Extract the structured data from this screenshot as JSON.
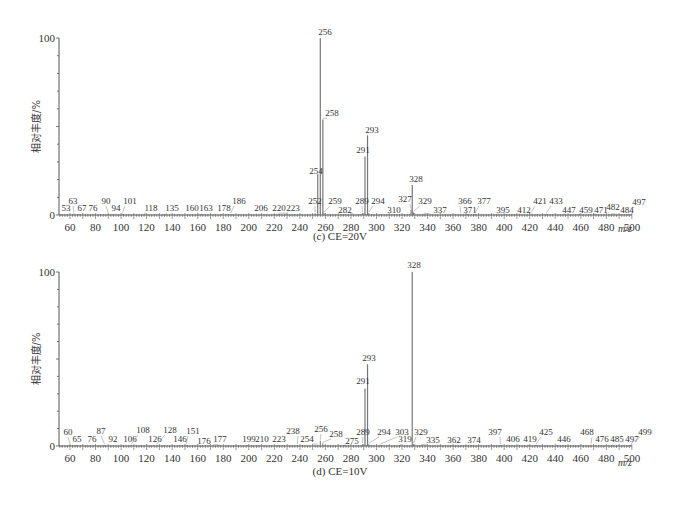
{
  "chart_data": [
    {
      "type": "bar",
      "subtype": "mass-spectrum",
      "title": "(c) CE=20V",
      "xlabel": "m/z",
      "ylabel": "相对丰度/%",
      "xlim": [
        50,
        500
      ],
      "ylim": [
        0,
        100
      ],
      "xticks": [
        60,
        80,
        100,
        120,
        140,
        160,
        180,
        200,
        220,
        240,
        260,
        280,
        300,
        320,
        340,
        360,
        380,
        400,
        420,
        440,
        460,
        480,
        500
      ],
      "yticks": [
        0,
        100
      ],
      "peaks": [
        {
          "mz": 53,
          "intensity": 0.5
        },
        {
          "mz": 63,
          "intensity": 0.8
        },
        {
          "mz": 67,
          "intensity": 0.4
        },
        {
          "mz": 76,
          "intensity": 0.4
        },
        {
          "mz": 90,
          "intensity": 0.6
        },
        {
          "mz": 94,
          "intensity": 0.4
        },
        {
          "mz": 101,
          "intensity": 0.6
        },
        {
          "mz": 118,
          "intensity": 0.4
        },
        {
          "mz": 135,
          "intensity": 0.4
        },
        {
          "mz": 160,
          "intensity": 0.4
        },
        {
          "mz": 163,
          "intensity": 0.4
        },
        {
          "mz": 178,
          "intensity": 0.4
        },
        {
          "mz": 186,
          "intensity": 0.6
        },
        {
          "mz": 206,
          "intensity": 0.4
        },
        {
          "mz": 220,
          "intensity": 0.4
        },
        {
          "mz": 223,
          "intensity": 0.4
        },
        {
          "mz": 252,
          "intensity": 1.0
        },
        {
          "mz": 254,
          "intensity": 23
        },
        {
          "mz": 256,
          "intensity": 100
        },
        {
          "mz": 258,
          "intensity": 54
        },
        {
          "mz": 259,
          "intensity": 1.0
        },
        {
          "mz": 282,
          "intensity": 0.6
        },
        {
          "mz": 289,
          "intensity": 1.0
        },
        {
          "mz": 291,
          "intensity": 33
        },
        {
          "mz": 293,
          "intensity": 45
        },
        {
          "mz": 294,
          "intensity": 1.0
        },
        {
          "mz": 310,
          "intensity": 0.5
        },
        {
          "mz": 327,
          "intensity": 3
        },
        {
          "mz": 328,
          "intensity": 17
        },
        {
          "mz": 329,
          "intensity": 1.5
        },
        {
          "mz": 337,
          "intensity": 0.5
        },
        {
          "mz": 366,
          "intensity": 0.6
        },
        {
          "mz": 371,
          "intensity": 0.5
        },
        {
          "mz": 377,
          "intensity": 0.6
        },
        {
          "mz": 395,
          "intensity": 0.4
        },
        {
          "mz": 412,
          "intensity": 0.4
        },
        {
          "mz": 421,
          "intensity": 0.6
        },
        {
          "mz": 433,
          "intensity": 0.6
        },
        {
          "mz": 447,
          "intensity": 0.4
        },
        {
          "mz": 459,
          "intensity": 0.4
        },
        {
          "mz": 471,
          "intensity": 0.4
        },
        {
          "mz": 482,
          "intensity": 0.5
        },
        {
          "mz": 484,
          "intensity": 0.4
        },
        {
          "mz": 497,
          "intensity": 0.6
        }
      ]
    },
    {
      "type": "bar",
      "subtype": "mass-spectrum",
      "title": "(d) CE=10V",
      "xlabel": "m/z",
      "ylabel": "相对丰度/%",
      "xlim": [
        50,
        500
      ],
      "ylim": [
        0,
        100
      ],
      "xticks": [
        60,
        80,
        100,
        120,
        140,
        160,
        180,
        200,
        220,
        240,
        260,
        280,
        300,
        320,
        340,
        360,
        380,
        400,
        420,
        440,
        460,
        480,
        500
      ],
      "yticks": [
        0,
        100
      ],
      "peaks": [
        {
          "mz": 60,
          "intensity": 0.6
        },
        {
          "mz": 65,
          "intensity": 0.4
        },
        {
          "mz": 76,
          "intensity": 0.4
        },
        {
          "mz": 87,
          "intensity": 0.6
        },
        {
          "mz": 92,
          "intensity": 0.4
        },
        {
          "mz": 106,
          "intensity": 0.4
        },
        {
          "mz": 108,
          "intensity": 0.6
        },
        {
          "mz": 126,
          "intensity": 0.4
        },
        {
          "mz": 128,
          "intensity": 0.6
        },
        {
          "mz": 146,
          "intensity": 0.4
        },
        {
          "mz": 151,
          "intensity": 0.6
        },
        {
          "mz": 176,
          "intensity": 0.4
        },
        {
          "mz": 177,
          "intensity": 0.4
        },
        {
          "mz": 199,
          "intensity": 0.4
        },
        {
          "mz": 210,
          "intensity": 0.4
        },
        {
          "mz": 223,
          "intensity": 0.4
        },
        {
          "mz": 238,
          "intensity": 0.6
        },
        {
          "mz": 254,
          "intensity": 0.6
        },
        {
          "mz": 256,
          "intensity": 3
        },
        {
          "mz": 258,
          "intensity": 1.5
        },
        {
          "mz": 275,
          "intensity": 0.4
        },
        {
          "mz": 289,
          "intensity": 1.0
        },
        {
          "mz": 291,
          "intensity": 33
        },
        {
          "mz": 293,
          "intensity": 47
        },
        {
          "mz": 294,
          "intensity": 1.0
        },
        {
          "mz": 303,
          "intensity": 0.6
        },
        {
          "mz": 319,
          "intensity": 0.4
        },
        {
          "mz": 328,
          "intensity": 100
        },
        {
          "mz": 329,
          "intensity": 1.0
        },
        {
          "mz": 335,
          "intensity": 0.4
        },
        {
          "mz": 362,
          "intensity": 0.4
        },
        {
          "mz": 374,
          "intensity": 0.4
        },
        {
          "mz": 397,
          "intensity": 0.6
        },
        {
          "mz": 406,
          "intensity": 0.4
        },
        {
          "mz": 419,
          "intensity": 0.4
        },
        {
          "mz": 425,
          "intensity": 0.6
        },
        {
          "mz": 446,
          "intensity": 0.4
        },
        {
          "mz": 468,
          "intensity": 0.6
        },
        {
          "mz": 476,
          "intensity": 0.4
        },
        {
          "mz": 485,
          "intensity": 0.4
        },
        {
          "mz": 497,
          "intensity": 0.4
        },
        {
          "mz": 499,
          "intensity": 0.6
        }
      ]
    }
  ],
  "labels_layout": [
    [
      {
        "mz": 53,
        "lx": 66,
        "ly": 211
      },
      {
        "mz": 63,
        "lx": 73,
        "ly": 204
      },
      {
        "mz": 67,
        "lx": 82,
        "ly": 211
      },
      {
        "mz": 76,
        "lx": 93,
        "ly": 211
      },
      {
        "mz": 90,
        "lx": 106,
        "ly": 204
      },
      {
        "mz": 94,
        "lx": 116,
        "ly": 211
      },
      {
        "mz": 101,
        "lx": 130,
        "ly": 204
      },
      {
        "mz": 118,
        "lx": 151,
        "ly": 211
      },
      {
        "mz": 135,
        "lx": 172,
        "ly": 211
      },
      {
        "mz": 160,
        "lx": 192,
        "ly": 211
      },
      {
        "mz": 163,
        "lx": 206,
        "ly": 211
      },
      {
        "mz": 178,
        "lx": 224,
        "ly": 211
      },
      {
        "mz": 186,
        "lx": 239,
        "ly": 204
      },
      {
        "mz": 206,
        "lx": 261,
        "ly": 211
      },
      {
        "mz": 220,
        "lx": 279,
        "ly": 211
      },
      {
        "mz": 223,
        "lx": 293,
        "ly": 211
      },
      {
        "mz": 252,
        "lx": 315,
        "ly": 204
      },
      {
        "mz": 254,
        "lx": 316,
        "ly": 174
      },
      {
        "mz": 256,
        "lx": 325,
        "ly": 35
      },
      {
        "mz": 258,
        "lx": 332,
        "ly": 116
      },
      {
        "mz": 259,
        "lx": 335,
        "ly": 204
      },
      {
        "mz": 282,
        "lx": 345,
        "ly": 213
      },
      {
        "mz": 289,
        "lx": 362,
        "ly": 204
      },
      {
        "mz": 291,
        "lx": 363,
        "ly": 153
      },
      {
        "mz": 293,
        "lx": 372,
        "ly": 133
      },
      {
        "mz": 294,
        "lx": 378,
        "ly": 204
      },
      {
        "mz": 310,
        "lx": 394,
        "ly": 213
      },
      {
        "mz": 327,
        "lx": 405,
        "ly": 202
      },
      {
        "mz": 328,
        "lx": 416,
        "ly": 182
      },
      {
        "mz": 329,
        "lx": 425,
        "ly": 204
      },
      {
        "mz": 337,
        "lx": 440,
        "ly": 213
      },
      {
        "mz": 366,
        "lx": 465,
        "ly": 204
      },
      {
        "mz": 371,
        "lx": 470,
        "ly": 213
      },
      {
        "mz": 377,
        "lx": 484,
        "ly": 204
      },
      {
        "mz": 395,
        "lx": 503,
        "ly": 213
      },
      {
        "mz": 412,
        "lx": 524,
        "ly": 213
      },
      {
        "mz": 421,
        "lx": 540,
        "ly": 204
      },
      {
        "mz": 433,
        "lx": 556,
        "ly": 204
      },
      {
        "mz": 447,
        "lx": 569,
        "ly": 213
      },
      {
        "mz": 459,
        "lx": 586,
        "ly": 213
      },
      {
        "mz": 471,
        "lx": 601,
        "ly": 213
      },
      {
        "mz": 482,
        "lx": 613,
        "ly": 210
      },
      {
        "mz": 484,
        "lx": 627,
        "ly": 213
      },
      {
        "mz": 497,
        "lx": 639,
        "ly": 205
      }
    ],
    [
      {
        "mz": 60,
        "lx": 68,
        "ly": 435
      },
      {
        "mz": 65,
        "lx": 77,
        "ly": 442
      },
      {
        "mz": 76,
        "lx": 92,
        "ly": 442
      },
      {
        "mz": 87,
        "lx": 101,
        "ly": 434
      },
      {
        "mz": 92,
        "lx": 113,
        "ly": 442
      },
      {
        "mz": 106,
        "lx": 130,
        "ly": 442
      },
      {
        "mz": 108,
        "lx": 143,
        "ly": 433
      },
      {
        "mz": 126,
        "lx": 155,
        "ly": 442
      },
      {
        "mz": 128,
        "lx": 170,
        "ly": 433
      },
      {
        "mz": 146,
        "lx": 180,
        "ly": 442
      },
      {
        "mz": 151,
        "lx": 193,
        "ly": 434
      },
      {
        "mz": 176,
        "lx": 204,
        "ly": 444
      },
      {
        "mz": 177,
        "lx": 220,
        "ly": 442
      },
      {
        "mz": 199,
        "lx": 249,
        "ly": 442
      },
      {
        "mz": 210,
        "lx": 262,
        "ly": 442
      },
      {
        "mz": 223,
        "lx": 279,
        "ly": 442
      },
      {
        "mz": 238,
        "lx": 293,
        "ly": 434
      },
      {
        "mz": 254,
        "lx": 307,
        "ly": 442
      },
      {
        "mz": 256,
        "lx": 321,
        "ly": 432
      },
      {
        "mz": 258,
        "lx": 336,
        "ly": 437
      },
      {
        "mz": 275,
        "lx": 352,
        "ly": 444
      },
      {
        "mz": 289,
        "lx": 363,
        "ly": 435
      },
      {
        "mz": 291,
        "lx": 363,
        "ly": 384
      },
      {
        "mz": 293,
        "lx": 369,
        "ly": 361
      },
      {
        "mz": 294,
        "lx": 384,
        "ly": 435
      },
      {
        "mz": 303,
        "lx": 402,
        "ly": 435
      },
      {
        "mz": 319,
        "lx": 405,
        "ly": 442
      },
      {
        "mz": 328,
        "lx": 414,
        "ly": 268
      },
      {
        "mz": 329,
        "lx": 421,
        "ly": 435
      },
      {
        "mz": 335,
        "lx": 433,
        "ly": 443
      },
      {
        "mz": 362,
        "lx": 454,
        "ly": 443
      },
      {
        "mz": 374,
        "lx": 474,
        "ly": 443
      },
      {
        "mz": 397,
        "lx": 495,
        "ly": 435
      },
      {
        "mz": 406,
        "lx": 513,
        "ly": 442
      },
      {
        "mz": 419,
        "lx": 530,
        "ly": 442
      },
      {
        "mz": 425,
        "lx": 546,
        "ly": 435
      },
      {
        "mz": 446,
        "lx": 564,
        "ly": 442
      },
      {
        "mz": 468,
        "lx": 587,
        "ly": 435
      },
      {
        "mz": 476,
        "lx": 602,
        "ly": 442
      },
      {
        "mz": 485,
        "lx": 617,
        "ly": 442
      },
      {
        "mz": 497,
        "lx": 632,
        "ly": 442
      },
      {
        "mz": 499,
        "lx": 645,
        "ly": 435
      }
    ]
  ],
  "panels": [
    {
      "y100": 38,
      "y0": 215,
      "caption_y": 240,
      "mz_y": 232
    },
    {
      "y100": 272,
      "y0": 446,
      "caption_y": 475,
      "mz_y": 466
    }
  ],
  "axis": {
    "x_left": 59,
    "x_right": 632,
    "mz_at_left": 51.3,
    "px_per_mz": 1.277
  },
  "colors": {
    "axis": "#555555",
    "peak": "#777777",
    "text": "#333333"
  }
}
